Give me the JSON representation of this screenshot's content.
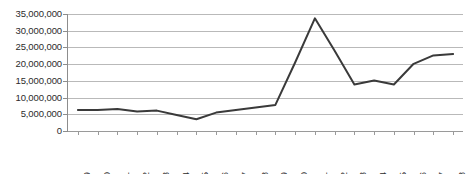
{
  "chart_data": {
    "type": "line",
    "title": "",
    "subtitle": "",
    "xlabel": "",
    "ylabel": "",
    "grid": "horizontal",
    "legend": "none",
    "ylim": [
      0,
      35000000
    ],
    "ytick_step": 5000000,
    "ytick_labels": [
      "35,000,000",
      "30,000,000",
      "25,000,000",
      "20,000,000",
      "15,000,000",
      "10,000,000",
      "5,000,000",
      "0"
    ],
    "ytick_values": [
      35000000,
      30000000,
      25000000,
      20000000,
      15000000,
      10000000,
      5000000,
      0
    ],
    "categories": [
      "1989",
      "1990",
      "1991",
      "1992",
      "1993",
      "1994",
      "1995",
      "1996",
      "1997",
      "1998",
      "1999",
      "2000",
      "2001",
      "2002",
      "2003",
      "2004",
      "2005",
      "2006",
      "2007",
      "2008"
    ],
    "series": [
      {
        "name": "Series 1",
        "color": "#3a3a3a",
        "line_width": 2,
        "markers": "none",
        "values": [
          6300000,
          6300000,
          6600000,
          5800000,
          6100000,
          4800000,
          3500000,
          5500000,
          6300000,
          7000000,
          7800000,
          20500000,
          33700000,
          24000000,
          13900000,
          15100000,
          13900000,
          20100000,
          22600000,
          23000000
        ]
      }
    ]
  },
  "style": {
    "background": "#ffffff",
    "gridline_color": "#b9b9b9",
    "axis_color": "#8d8d8d",
    "text_color": "#2b2b2b",
    "line_color": "#3a3a3a"
  }
}
